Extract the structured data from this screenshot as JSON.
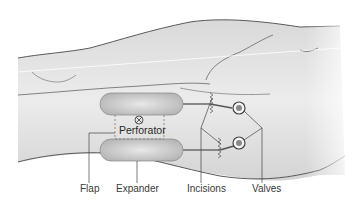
{
  "diagram": {
    "type": "medical-illustration",
    "labels": {
      "perforator": "Perforator",
      "flap": "Flap",
      "expander": "Expander",
      "incisions": "Incisions",
      "valves": "Valves"
    },
    "perforator_symbol": "⊗",
    "colors": {
      "skin_fill": "#e6e6e6",
      "outline": "#5a5a5a",
      "expander_fill": "#c4c4c4",
      "dashed_flap_border": "#777777",
      "leader_line": "#444444"
    }
  }
}
